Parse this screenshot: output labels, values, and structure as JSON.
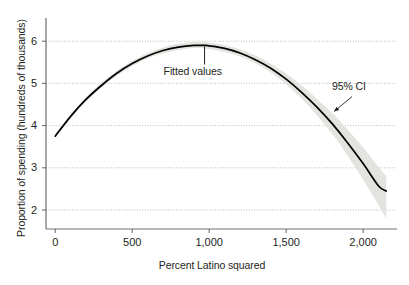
{
  "chart_data": {
    "type": "line",
    "title": "",
    "xlabel": "Percent Latino squared",
    "ylabel": "Proportion of spending (hundreds of thousands)",
    "xlim": [
      -60,
      2220
    ],
    "ylim": [
      1.55,
      6.55
    ],
    "xticks": [
      0,
      500,
      1000,
      1500,
      2000
    ],
    "xticklabels": [
      "0",
      "500",
      "1,000",
      "1,500",
      "2,000"
    ],
    "yticks": [
      2,
      3,
      4,
      5,
      6
    ],
    "yticklabels": [
      "2",
      "3",
      "4",
      "5",
      "6"
    ],
    "grid": "horizontal-dotted",
    "legend": "none",
    "series": [
      {
        "name": "Fitted values",
        "type": "line",
        "color": "#000000",
        "x": [
          0,
          100,
          200,
          300,
          400,
          500,
          600,
          700,
          800,
          900,
          970,
          1000,
          1100,
          1200,
          1300,
          1400,
          1500,
          1600,
          1700,
          1800,
          1900,
          2000,
          2100,
          2150
        ],
        "y": [
          3.75,
          4.22,
          4.62,
          4.95,
          5.24,
          5.47,
          5.65,
          5.78,
          5.86,
          5.9,
          5.9,
          5.89,
          5.83,
          5.72,
          5.56,
          5.36,
          5.1,
          4.79,
          4.44,
          4.04,
          3.59,
          3.1,
          2.57,
          2.45
        ]
      },
      {
        "name": "95% CI",
        "type": "band",
        "color": "#e3e3df",
        "x": [
          0,
          200,
          400,
          600,
          800,
          970,
          1200,
          1400,
          1600,
          1800,
          1900,
          2000,
          2100,
          2150
        ],
        "lower": [
          3.72,
          4.57,
          5.18,
          5.59,
          5.79,
          5.83,
          5.64,
          5.26,
          4.64,
          3.8,
          3.28,
          2.72,
          2.12,
          1.8
        ],
        "upper": [
          3.8,
          4.68,
          5.3,
          5.72,
          5.94,
          5.98,
          5.81,
          5.47,
          4.95,
          4.29,
          3.9,
          3.48,
          3.02,
          2.8
        ]
      }
    ],
    "annotations": [
      {
        "name": "fitted-values",
        "text": "Fitted values",
        "x": 970,
        "y": 5.9,
        "pointer": "leader-line-up"
      },
      {
        "name": "ci-label",
        "text": "95% CI",
        "x": 1980,
        "y": 4.95,
        "pointer": "arrow-down-left"
      }
    ]
  },
  "colors": {
    "curve": "#000000",
    "band": "#e3e3df",
    "axis": "#6d6e71",
    "grid": "#a7a9ac",
    "text": "#231f20",
    "background": "#ffffff"
  }
}
